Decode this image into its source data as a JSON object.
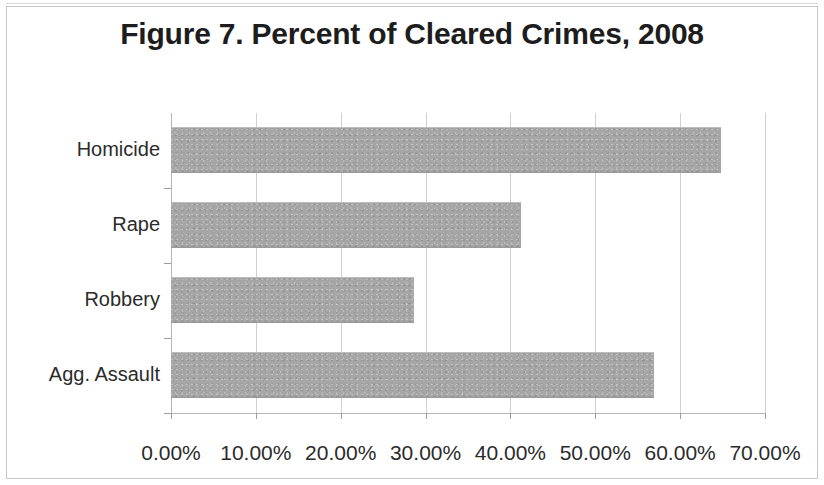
{
  "figure": {
    "title": "Figure 7. Percent of Cleared Crimes, 2008"
  },
  "chart_data": {
    "type": "bar",
    "orientation": "horizontal",
    "title": "Figure 7. Percent of Cleared Crimes, 2008",
    "xlabel": "",
    "ylabel": "",
    "categories": [
      "Homicide",
      "Rape",
      "Robbery",
      "Agg. Assault"
    ],
    "values": [
      64.8,
      41.3,
      28.6,
      56.9
    ],
    "value_labels": [
      "64.80%",
      "41.30%",
      "28.60%",
      "56.90%"
    ],
    "xlim": [
      0,
      70
    ],
    "xtick_values": [
      0,
      10,
      20,
      30,
      40,
      50,
      60,
      70
    ],
    "xtick_labels": [
      "0.00%",
      "10.00%",
      "20.00%",
      "30.00%",
      "40.00%",
      "50.00%",
      "60.00%",
      "70.00%"
    ],
    "grid": "vertical",
    "legend": "none",
    "series": [
      {
        "name": "Percent Cleared",
        "color": "#a6a6a6",
        "values": [
          64.8,
          41.3,
          28.6,
          56.9
        ]
      }
    ]
  },
  "colors": {
    "bar_fill": "#a6a6a6",
    "gridline": "#d0d0d0",
    "axis": "#b5b5b5",
    "text": "#2b2b2b",
    "title": "#1d1d1d",
    "background": "#ffffff"
  }
}
